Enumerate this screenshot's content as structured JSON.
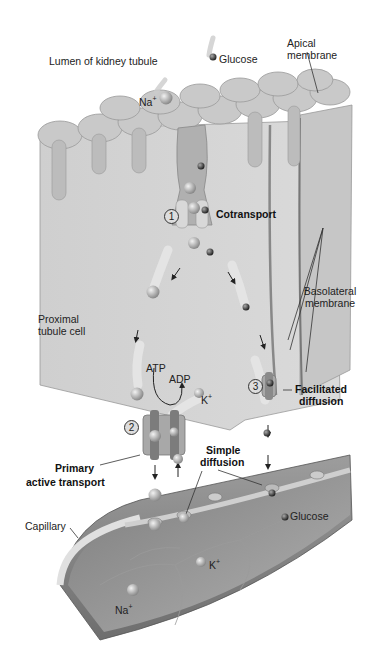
{
  "figure": {
    "regions": {
      "lumen": "Lumen of kidney tubule",
      "apical_membrane": "Apical membrane",
      "cell": "Proximal tubule cell",
      "basolateral_membrane": "Basolateral membrane",
      "capillary": "Capillary"
    },
    "molecules": {
      "glucose_top": "Glucose",
      "na_top": "Na",
      "k_cell": "K",
      "glucose_bottom": "Glucose",
      "k_capillary": "K",
      "na_capillary": "Na",
      "plus": "+"
    },
    "energy": {
      "atp": "ATP",
      "adp": "ADP"
    },
    "steps": [
      {
        "number": "1",
        "label": "Cotransport"
      },
      {
        "number": "2",
        "label_line1": "Primary",
        "label_line2": "active transport"
      },
      {
        "number": "3",
        "label_line1": "Facilitated",
        "label_line2": "diffusion"
      }
    ],
    "simple_diffusion": {
      "line1": "Simple",
      "line2": "diffusion"
    },
    "colors": {
      "cell_fill": "#d2d2d2",
      "cell_side": "#bdbdbd",
      "capillary_outer": "#a8a8a8",
      "capillary_inner": "#8f8f8f",
      "na_ion": "#b5b5b5",
      "glucose": "#555555"
    }
  }
}
